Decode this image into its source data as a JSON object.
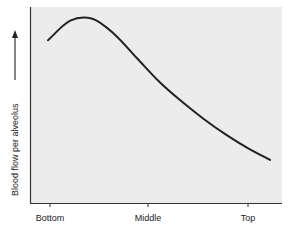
{
  "chart_data": {
    "type": "line",
    "title": "",
    "xlabel": "",
    "ylabel": "Blood flow per alveolus",
    "x_ticks": [
      "Bottom",
      "Middle",
      "Top"
    ],
    "x": [
      0.0,
      0.1,
      0.2,
      0.3,
      0.4,
      0.5,
      0.6,
      0.7,
      0.8,
      0.9,
      1.0
    ],
    "series": [
      {
        "name": "Blood flow per alveolus",
        "values": [
          0.83,
          0.93,
          0.94,
          0.86,
          0.74,
          0.62,
          0.52,
          0.43,
          0.35,
          0.28,
          0.22
        ]
      }
    ],
    "x_range": [
      "Bottom",
      "Top"
    ],
    "ylim": [
      0,
      1
    ],
    "grid": false,
    "legend": "none",
    "y_axis_arrow": "up",
    "colors": {
      "plot_bg": "#ececec",
      "line": "#222222",
      "axis": "#333333"
    }
  }
}
